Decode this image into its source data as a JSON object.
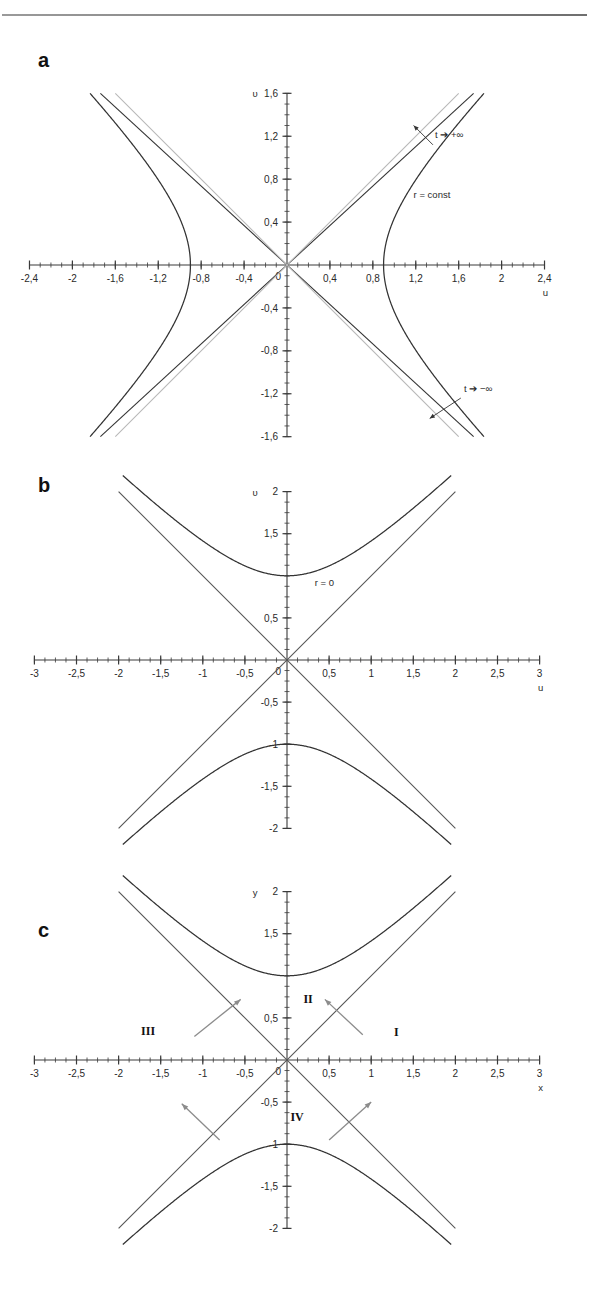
{
  "figure": {
    "background": "#ffffff",
    "rule_color": "#7a7a7a"
  },
  "panels": [
    {
      "id": "a",
      "letter": "a",
      "xlabel": "u",
      "ylabel": "υ",
      "xticks": [
        "-2,4",
        "-2",
        "-1,6",
        "-1,2",
        "-0,8",
        "-0,4",
        "0,4",
        "0,8",
        "1,2",
        "1,6",
        "2",
        "2,4"
      ],
      "yticks": [
        "1,6",
        "1,2",
        "0,8",
        "0,4",
        "-0,4",
        "-0,8",
        "-1,2",
        "-1,6"
      ],
      "origin_label": "0",
      "annotations": [
        {
          "name": "t-plus-infinity",
          "text": "t ➔ +∞"
        },
        {
          "name": "r-const",
          "text": "r = const"
        },
        {
          "name": "t-minus-infinity",
          "text": "t ➔ −∞"
        }
      ]
    },
    {
      "id": "b",
      "letter": "b",
      "xlabel": "u",
      "ylabel": "υ",
      "xticks": [
        "-3",
        "-2,5",
        "-2",
        "-1,5",
        "-1",
        "-0,5",
        "0,5",
        "1",
        "1,5",
        "2",
        "2,5",
        "3"
      ],
      "yticks": [
        "2",
        "1,5",
        "0,5",
        "-0,5",
        "-1",
        "-1,5",
        "-2"
      ],
      "origin_label": "0",
      "annotations": [
        {
          "name": "r-zero",
          "text": "r = 0"
        }
      ]
    },
    {
      "id": "c",
      "letter": "c",
      "xlabel": "x",
      "ylabel": "y",
      "xticks": [
        "-3",
        "-2,5",
        "-2",
        "-1,5",
        "-1",
        "-0,5",
        "0,5",
        "1",
        "1,5",
        "2",
        "2,5",
        "3"
      ],
      "yticks": [
        "2",
        "1,5",
        "0,5",
        "-0,5",
        "-1",
        "-1,5",
        "-2"
      ],
      "origin_label": "0",
      "regions": [
        "I",
        "II",
        "III",
        "IV"
      ]
    }
  ],
  "chart_data": [
    {
      "type": "line",
      "panel": "a",
      "title": "",
      "xlabel": "u",
      "ylabel": "υ",
      "xlim": [
        -2.4,
        2.4
      ],
      "ylim": [
        -1.6,
        1.6
      ],
      "grid": false,
      "legend": "none",
      "xtick_values": [
        -2.4,
        -2.0,
        -1.6,
        -1.2,
        -0.8,
        -0.4,
        0.4,
        0.8,
        1.2,
        1.6,
        2.0,
        2.4
      ],
      "ytick_values": [
        1.6,
        1.2,
        0.8,
        0.4,
        -0.4,
        -0.8,
        -1.2,
        -1.6
      ],
      "minor_tick_step": 0.1,
      "series": [
        {
          "name": "hyperbola r = const (right branch)",
          "equation": "u^2 - v^2 = 0.9^2",
          "vertex": [
            0.9,
            0
          ],
          "color": "#333333"
        },
        {
          "name": "hyperbola r = const (left branch)",
          "equation": "u^2 - v^2 = 0.9^2",
          "vertex": [
            -0.9,
            0
          ],
          "color": "#333333"
        },
        {
          "name": "asymptote-dark-positive",
          "equation": "v = 0.92 u",
          "color": "#333333"
        },
        {
          "name": "asymptote-dark-negative",
          "equation": "v = -0.92 u",
          "color": "#333333"
        },
        {
          "name": "asymptote-gray-positive",
          "equation": "v = 1.0 u",
          "color": "#b8b8b8"
        },
        {
          "name": "asymptote-gray-negative",
          "equation": "v = -1.0 u",
          "color": "#b8b8b8"
        }
      ],
      "annotations": [
        {
          "text": "t ➔ +∞",
          "at": [
            1.38,
            1.18
          ]
        },
        {
          "text": "r = const",
          "at": [
            1.18,
            0.62
          ]
        },
        {
          "text": "t ➔ −∞",
          "at": [
            1.65,
            -1.18
          ]
        }
      ]
    },
    {
      "type": "line",
      "panel": "b",
      "title": "",
      "xlabel": "u",
      "ylabel": "υ",
      "xlim": [
        -3,
        3
      ],
      "ylim": [
        -2,
        2
      ],
      "grid": false,
      "legend": "none",
      "xtick_values": [
        -3,
        -2.5,
        -2,
        -1.5,
        -1,
        -0.5,
        0.5,
        1,
        1.5,
        2,
        2.5,
        3
      ],
      "ytick_values": [
        2,
        1.5,
        0.5,
        -0.5,
        -1,
        -1.5,
        -2
      ],
      "minor_tick_step": 0.125,
      "series": [
        {
          "name": "hyperbola r = 0 (upper branch)",
          "equation": "v^2 - u^2 = 1",
          "vertex": [
            0,
            1
          ],
          "color": "#333333"
        },
        {
          "name": "hyperbola r = 0 (lower branch)",
          "equation": "v^2 - u^2 = 1",
          "vertex": [
            0,
            -1
          ],
          "color": "#333333"
        },
        {
          "name": "asymptote-positive",
          "equation": "v = u",
          "color": "#555555"
        },
        {
          "name": "asymptote-negative",
          "equation": "v = -u",
          "color": "#555555"
        }
      ],
      "annotations": [
        {
          "text": "r = 0",
          "at": [
            0.33,
            0.88
          ]
        }
      ]
    },
    {
      "type": "line",
      "panel": "c",
      "title": "",
      "xlabel": "x",
      "ylabel": "y",
      "xlim": [
        -3,
        3
      ],
      "ylim": [
        -2,
        2
      ],
      "grid": false,
      "legend": "none",
      "xtick_values": [
        -3,
        -2.5,
        -2,
        -1.5,
        -1,
        -0.5,
        0.5,
        1,
        1.5,
        2,
        2.5,
        3
      ],
      "ytick_values": [
        2,
        1.5,
        0.5,
        -0.5,
        -1,
        -1.5,
        -2
      ],
      "minor_tick_step": 0.125,
      "series": [
        {
          "name": "hyperbola upper branch",
          "equation": "y^2 - x^2 = 1",
          "vertex": [
            0,
            1
          ],
          "color": "#333333"
        },
        {
          "name": "hyperbola lower branch",
          "equation": "y^2 - x^2 = 1",
          "vertex": [
            0,
            -1
          ],
          "color": "#333333"
        },
        {
          "name": "asymptote-positive",
          "equation": "y = x",
          "color": "#555555"
        },
        {
          "name": "asymptote-negative",
          "equation": "y = -x",
          "color": "#555555"
        }
      ],
      "annotations": [
        {
          "text": "I",
          "at": [
            1.3,
            0.28
          ]
        },
        {
          "text": "II",
          "at": [
            0.25,
            0.68
          ]
        },
        {
          "text": "III",
          "at": [
            -1.65,
            0.3
          ]
        },
        {
          "text": "IV",
          "at": [
            0.12,
            -0.72
          ]
        }
      ],
      "arrows": [
        {
          "name": "arrow-upper-left",
          "from": [
            -1.1,
            0.28
          ],
          "to": [
            -0.55,
            0.72
          ],
          "color": "#8c8c8c"
        },
        {
          "name": "arrow-upper-right",
          "from": [
            0.9,
            0.3
          ],
          "to": [
            0.45,
            0.72
          ],
          "color": "#8c8c8c"
        },
        {
          "name": "arrow-lower-left",
          "from": [
            -0.8,
            -0.95
          ],
          "to": [
            -1.25,
            -0.52
          ],
          "color": "#8c8c8c"
        },
        {
          "name": "arrow-lower-right",
          "from": [
            0.5,
            -0.95
          ],
          "to": [
            1.0,
            -0.5
          ],
          "color": "#8c8c8c"
        }
      ]
    }
  ]
}
